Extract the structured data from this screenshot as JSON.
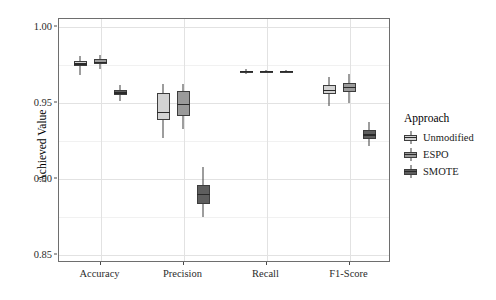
{
  "chart_data": {
    "type": "box",
    "title": "",
    "xlabel": "",
    "ylabel": "Achieved Value",
    "ylim": [
      0.845,
      1.005
    ],
    "yticks": [
      1.0,
      0.95,
      0.9,
      0.85
    ],
    "ytick_labels": [
      "1.00",
      "0.95",
      "0.90",
      "0.85"
    ],
    "categories": [
      "Accuracy",
      "Precision",
      "Recall",
      "F1-Score"
    ],
    "grid": true,
    "legend": {
      "title": "Approach",
      "position": "right",
      "entries": [
        {
          "label": "Unmodified",
          "color": "#d3d3d3"
        },
        {
          "label": "ESPO",
          "color": "#9a9a9a"
        },
        {
          "label": "SMOTE",
          "color": "#5e5e5e"
        }
      ]
    },
    "series": [
      {
        "name": "Unmodified",
        "color": "#d3d3d3",
        "boxes": [
          {
            "category": "Accuracy",
            "whisker_low": 0.9685,
            "q1": 0.9745,
            "median": 0.9755,
            "q3": 0.9775,
            "whisker_high": 0.981
          },
          {
            "category": "Precision",
            "whisker_low": 0.927,
            "q1": 0.939,
            "median": 0.9435,
            "q3": 0.9565,
            "whisker_high": 0.9625
          },
          {
            "category": "Recall",
            "whisker_low": 0.969,
            "q1": 0.97,
            "median": 0.9705,
            "q3": 0.971,
            "whisker_high": 0.972
          },
          {
            "category": "F1-Score",
            "whisker_low": 0.948,
            "q1": 0.9555,
            "median": 0.958,
            "q3": 0.9615,
            "whisker_high": 0.967
          }
        ]
      },
      {
        "name": "ESPO",
        "color": "#9a9a9a",
        "boxes": [
          {
            "category": "Accuracy",
            "whisker_low": 0.9725,
            "q1": 0.9755,
            "median": 0.9765,
            "q3": 0.9785,
            "whisker_high": 0.9815
          },
          {
            "category": "Precision",
            "whisker_low": 0.933,
            "q1": 0.9415,
            "median": 0.949,
            "q3": 0.958,
            "whisker_high": 0.9625
          },
          {
            "category": "Recall",
            "whisker_low": 0.97,
            "q1": 0.9703,
            "median": 0.9706,
            "q3": 0.971,
            "whisker_high": 0.9713
          },
          {
            "category": "F1-Score",
            "whisker_low": 0.95,
            "q1": 0.957,
            "median": 0.96,
            "q3": 0.963,
            "whisker_high": 0.969
          }
        ]
      },
      {
        "name": "SMOTE",
        "color": "#5e5e5e",
        "boxes": [
          {
            "category": "Accuracy",
            "whisker_low": 0.951,
            "q1": 0.955,
            "median": 0.9565,
            "q3": 0.9585,
            "whisker_high": 0.962
          },
          {
            "category": "Precision",
            "whisker_low": 0.875,
            "q1": 0.884,
            "median": 0.89,
            "q3": 0.896,
            "whisker_high": 0.908
          },
          {
            "category": "Recall",
            "whisker_low": 0.97,
            "q1": 0.9703,
            "median": 0.9706,
            "q3": 0.971,
            "whisker_high": 0.9713
          },
          {
            "category": "F1-Score",
            "whisker_low": 0.9215,
            "q1": 0.9265,
            "median": 0.929,
            "q3": 0.932,
            "whisker_high": 0.9375
          }
        ]
      }
    ]
  }
}
